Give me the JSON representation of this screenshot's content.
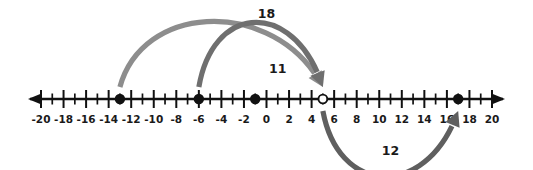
{
  "figure": {
    "type": "number-line-diagram",
    "background_color": "#ffffff",
    "axis_color": "#111111"
  },
  "number_line": {
    "min": -20,
    "max": 20,
    "tick_step": 1,
    "label_step": 2,
    "labels": [
      "-20",
      "-18",
      "-16",
      "-14",
      "-12",
      "-10",
      "-8",
      "-6",
      "-4",
      "-2",
      "0",
      "2",
      "4",
      "6",
      "8",
      "10",
      "12",
      "14",
      "16",
      "18",
      "20"
    ],
    "label_values": [
      -20,
      -18,
      -16,
      -14,
      -12,
      -10,
      -8,
      -6,
      -4,
      -2,
      0,
      2,
      4,
      6,
      8,
      10,
      12,
      14,
      16,
      18,
      20
    ],
    "left_arrow": true,
    "right_arrow": true
  },
  "points": [
    {
      "name": "point-neg13",
      "value": -13,
      "style": "filled",
      "color": "#111111"
    },
    {
      "name": "point-neg6",
      "value": -6,
      "style": "filled",
      "color": "#111111"
    },
    {
      "name": "point-neg1",
      "value": -1,
      "style": "filled",
      "color": "#111111"
    },
    {
      "name": "point-5",
      "value": 5,
      "style": "open",
      "color": "#111111"
    },
    {
      "name": "point-17",
      "value": 17,
      "style": "filled",
      "color": "#111111"
    }
  ],
  "arcs": [
    {
      "name": "arc-18",
      "label": "18",
      "from": -13,
      "to": 5,
      "side": "above",
      "color": "#8d8d8d",
      "label_x": 0,
      "label_y": 14
    },
    {
      "name": "arc-11",
      "label": "11",
      "from": -6,
      "to": 5,
      "side": "above",
      "color": "#6f6f6f",
      "label_x": 1,
      "label_y": 69
    },
    {
      "name": "arc-12",
      "label": "12",
      "from": 5,
      "to": 17,
      "side": "below",
      "color": "#5f5f5f",
      "label_x": 11,
      "label_y": 151
    }
  ],
  "chart_data": {
    "type": "number-line",
    "title": "",
    "xlabel": "",
    "ylabel": "",
    "xlim": [
      -20,
      20
    ],
    "tick_values": [
      -20,
      -19,
      -18,
      -17,
      -16,
      -15,
      -14,
      -13,
      -12,
      -11,
      -10,
      -9,
      -8,
      -7,
      -6,
      -5,
      -4,
      -3,
      -2,
      -1,
      0,
      1,
      2,
      3,
      4,
      5,
      6,
      7,
      8,
      9,
      10,
      11,
      12,
      13,
      14,
      15,
      16,
      17,
      18,
      19,
      20
    ],
    "labeled_ticks": [
      -20,
      -18,
      -16,
      -14,
      -12,
      -10,
      -8,
      -6,
      -4,
      -2,
      0,
      2,
      4,
      6,
      8,
      10,
      12,
      14,
      16,
      18,
      20
    ],
    "marked_points": [
      -13,
      -6,
      -1,
      5,
      17
    ],
    "open_points": [
      5
    ],
    "filled_points": [
      -13,
      -6,
      -1,
      17
    ],
    "jumps": [
      {
        "from": -13,
        "to": 5,
        "distance": 18,
        "label": "18"
      },
      {
        "from": -6,
        "to": 5,
        "distance": 11,
        "label": "11"
      },
      {
        "from": 5,
        "to": 17,
        "distance": 12,
        "label": "12"
      }
    ],
    "grid": false,
    "legend": "none"
  }
}
